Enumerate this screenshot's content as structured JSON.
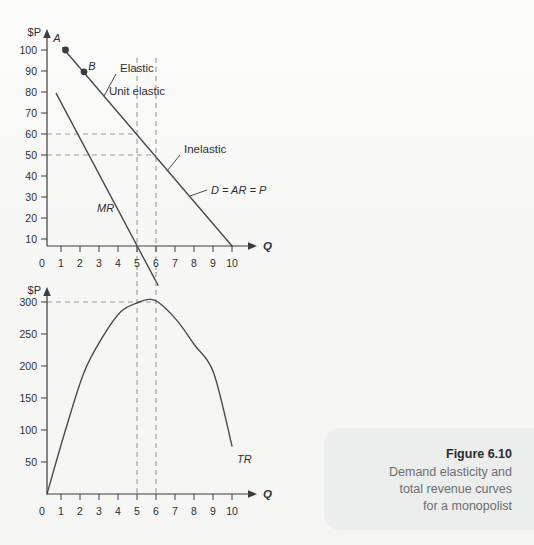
{
  "figure": {
    "number": "Figure 6.10",
    "caption_lines": [
      "Demand elasticity and",
      "total revenue curves",
      "for a monopolist"
    ]
  },
  "colors": {
    "page_background": "#f7f7f6",
    "caption_panel": "#eceded",
    "axis": "#3c3c3e",
    "curve": "#4a4a4d",
    "dashed_guide": "#9a9a9d",
    "caption_text": "#6a6d72",
    "title_text": "#2b2b2e"
  },
  "chart_data": [
    {
      "type": "line",
      "id": "demand-marginal-revenue",
      "title": "",
      "xlabel": "Q",
      "ylabel": "$P",
      "xlim": [
        0,
        10.6
      ],
      "ylim": [
        0,
        108
      ],
      "grid": false,
      "x_ticks": [
        0,
        1,
        2,
        3,
        4,
        5,
        6,
        7,
        8,
        9,
        10
      ],
      "x_tick_labels": [
        "0",
        "1",
        "2",
        "3",
        "4",
        "5",
        "6",
        "7",
        "8",
        "9",
        "10"
      ],
      "y_ticks": [
        10,
        20,
        30,
        40,
        50,
        60,
        70,
        80,
        90,
        100
      ],
      "y_tick_labels": [
        "10",
        "20",
        "30",
        "40",
        "50",
        "60",
        "70",
        "80",
        "90",
        "100"
      ],
      "series": [
        {
          "name": "D = AR = P",
          "label": "D = AR = P",
          "x": [
            0.85,
            10.0
          ],
          "y": [
            101,
            10
          ]
        },
        {
          "name": "MR",
          "label": "MR",
          "x": [
            0.5,
            6.0
          ],
          "y": [
            80,
            -8
          ]
        }
      ],
      "points": [
        {
          "label": "A",
          "x": 1,
          "y": 100
        },
        {
          "label": "B",
          "x": 2,
          "y": 90
        }
      ],
      "annotations": [
        {
          "text": "Elastic",
          "x": 3.0,
          "y": 93
        },
        {
          "text": "Unit elastic",
          "x": 4.9,
          "y": 83
        },
        {
          "text": "Inelastic",
          "x": 7.3,
          "y": 53
        },
        {
          "text": "D = AR = P",
          "x": 8.6,
          "y": 36
        },
        {
          "text": "MR",
          "x": 2.9,
          "y": 23
        }
      ],
      "guides": {
        "vertical_x": [
          5,
          6
        ],
        "horizontal_y": [
          60,
          50
        ]
      }
    },
    {
      "type": "line",
      "id": "total-revenue",
      "title": "",
      "xlabel": "Q",
      "ylabel": "$P",
      "xlim": [
        0,
        10.6
      ],
      "ylim": [
        0,
        325
      ],
      "grid": false,
      "x_ticks": [
        0,
        1,
        2,
        3,
        4,
        5,
        6,
        7,
        8,
        9,
        10
      ],
      "x_tick_labels": [
        "0",
        "1",
        "2",
        "3",
        "4",
        "5",
        "6",
        "7",
        "8",
        "9",
        "10"
      ],
      "y_ticks": [
        50,
        100,
        150,
        200,
        250,
        300
      ],
      "y_tick_labels": [
        "50",
        "100",
        "150",
        "200",
        "250",
        "300"
      ],
      "series": [
        {
          "name": "TR",
          "label": "TR",
          "x": [
            0,
            1,
            2,
            3,
            4,
            5,
            5.5,
            6,
            7,
            8,
            9,
            10
          ],
          "y": [
            0,
            100,
            190,
            245,
            285,
            300,
            304,
            300,
            272,
            232,
            190,
            75
          ]
        }
      ],
      "annotations": [
        {
          "text": "TR",
          "x": 10.1,
          "y": 72
        }
      ],
      "guides": {
        "vertical_x": [
          5,
          6
        ],
        "horizontal_y": [
          300
        ]
      }
    }
  ]
}
